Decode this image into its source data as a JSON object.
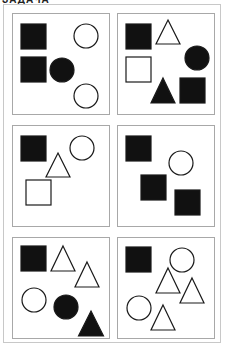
{
  "caption": "ЗАДАЧА",
  "panels": [
    {
      "id": "panel-1",
      "shapes": [
        {
          "type": "square",
          "fill": "black",
          "x": 8,
          "y": 10,
          "size": 25
        },
        {
          "type": "circle",
          "fill": "white",
          "cx": 73,
          "cy": 22,
          "r": 12
        },
        {
          "type": "square",
          "fill": "black",
          "x": 8,
          "y": 43,
          "size": 25
        },
        {
          "type": "circle",
          "fill": "black",
          "cx": 49,
          "cy": 56,
          "r": 12
        },
        {
          "type": "circle",
          "fill": "white",
          "cx": 73,
          "cy": 82,
          "r": 12
        }
      ]
    },
    {
      "id": "panel-2",
      "shapes": [
        {
          "type": "square",
          "fill": "black",
          "x": 8,
          "y": 10,
          "size": 25
        },
        {
          "type": "triangle",
          "fill": "white",
          "cx": 50,
          "top": 6,
          "w": 24,
          "h": 24
        },
        {
          "type": "circle",
          "fill": "black",
          "cx": 79,
          "cy": 44,
          "r": 12
        },
        {
          "type": "square",
          "fill": "white",
          "x": 8,
          "y": 43,
          "size": 25
        },
        {
          "type": "triangle",
          "fill": "black",
          "cx": 45,
          "top": 64,
          "w": 24,
          "h": 25
        },
        {
          "type": "square",
          "fill": "black",
          "x": 62,
          "y": 64,
          "size": 25
        }
      ]
    },
    {
      "id": "panel-3",
      "shapes": [
        {
          "type": "square",
          "fill": "black",
          "x": 8,
          "y": 10,
          "size": 25
        },
        {
          "type": "circle",
          "fill": "white",
          "cx": 69,
          "cy": 22,
          "r": 12
        },
        {
          "type": "triangle",
          "fill": "white",
          "cx": 45,
          "top": 27,
          "w": 24,
          "h": 24
        },
        {
          "type": "square",
          "fill": "white",
          "x": 13,
          "y": 54,
          "size": 25
        }
      ]
    },
    {
      "id": "panel-4",
      "shapes": [
        {
          "type": "square",
          "fill": "black",
          "x": 8,
          "y": 10,
          "size": 25
        },
        {
          "type": "circle",
          "fill": "white",
          "cx": 63,
          "cy": 37,
          "r": 12
        },
        {
          "type": "square",
          "fill": "black",
          "x": 23,
          "y": 49,
          "size": 25
        },
        {
          "type": "square",
          "fill": "black",
          "x": 57,
          "y": 64,
          "size": 25
        }
      ]
    },
    {
      "id": "panel-5",
      "shapes": [
        {
          "type": "square",
          "fill": "black",
          "x": 8,
          "y": 8,
          "size": 25
        },
        {
          "type": "triangle",
          "fill": "white",
          "cx": 50,
          "top": 8,
          "w": 24,
          "h": 25
        },
        {
          "type": "triangle",
          "fill": "white",
          "cx": 74,
          "top": 24,
          "w": 24,
          "h": 25
        },
        {
          "type": "circle",
          "fill": "white",
          "cx": 21,
          "cy": 62,
          "r": 12
        },
        {
          "type": "circle",
          "fill": "black",
          "cx": 53,
          "cy": 69,
          "r": 12
        },
        {
          "type": "triangle",
          "fill": "black",
          "cx": 78,
          "top": 73,
          "w": 25,
          "h": 25
        }
      ]
    },
    {
      "id": "panel-6",
      "shapes": [
        {
          "type": "square",
          "fill": "black",
          "x": 8,
          "y": 9,
          "size": 25
        },
        {
          "type": "circle",
          "fill": "white",
          "cx": 64,
          "cy": 22,
          "r": 12
        },
        {
          "type": "triangle",
          "fill": "white",
          "cx": 50,
          "top": 30,
          "w": 24,
          "h": 25
        },
        {
          "type": "triangle",
          "fill": "white",
          "cx": 74,
          "top": 40,
          "w": 24,
          "h": 25
        },
        {
          "type": "circle",
          "fill": "white",
          "cx": 21,
          "cy": 70,
          "r": 12
        },
        {
          "type": "triangle",
          "fill": "white",
          "cx": 45,
          "top": 67,
          "w": 24,
          "h": 25
        }
      ]
    }
  ],
  "colors": {
    "shape_stroke": "#1a1a1a",
    "black_fill": "#111111",
    "panel_border": "#a8a8a8",
    "outer_border": "#c8c8c8"
  }
}
